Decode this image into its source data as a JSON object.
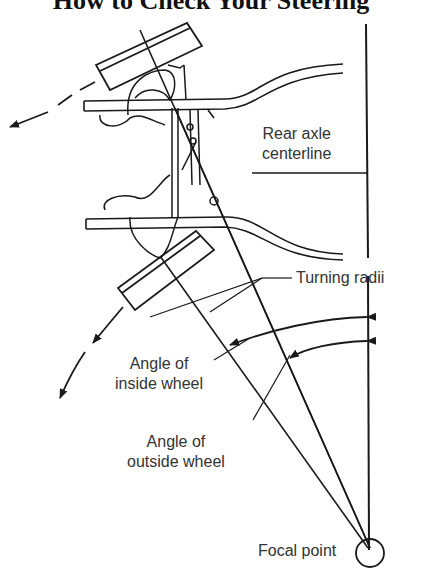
{
  "title": "How to Check Your Steering",
  "labels": {
    "rear_axle_line1": "Rear axle",
    "rear_axle_line2": "centerline",
    "turning_radii": "Turning radii",
    "inside_line1": "Angle of",
    "inside_line2": "inside wheel",
    "outside_line1": "Angle of",
    "outside_line2": "outside wheel",
    "focal_point": "Focal point"
  },
  "colors": {
    "ink": "#1a1a1a",
    "background": "#ffffff"
  }
}
